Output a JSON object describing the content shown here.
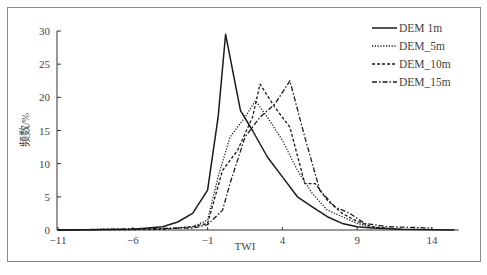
{
  "chart_data": {
    "type": "line",
    "title": "",
    "xlabel": "TWI",
    "ylabel": "频数/%",
    "xlim": [
      -11,
      16
    ],
    "ylim": [
      0,
      30
    ],
    "x_ticks": [
      -11,
      -6,
      -1,
      4,
      9,
      14
    ],
    "y_ticks": [
      0,
      5,
      10,
      15,
      20,
      25,
      30
    ],
    "grid": false,
    "legend_position": "upper right",
    "series": [
      {
        "name": "DEM  1m",
        "style": "solid",
        "points": [
          [
            -11,
            0
          ],
          [
            -6,
            0.1
          ],
          [
            -4,
            0.5
          ],
          [
            -3,
            1.2
          ],
          [
            -2,
            2.5
          ],
          [
            -1,
            6
          ],
          [
            -0.3,
            17
          ],
          [
            0.2,
            29.5
          ],
          [
            1.2,
            18
          ],
          [
            2,
            15
          ],
          [
            3,
            11
          ],
          [
            4,
            8
          ],
          [
            5,
            5
          ],
          [
            6,
            3.5
          ],
          [
            7,
            2
          ],
          [
            8,
            1
          ],
          [
            9,
            0.5
          ],
          [
            10,
            0.3
          ],
          [
            12,
            0.1
          ],
          [
            15.5,
            0
          ]
        ]
      },
      {
        "name": "DEM_5m",
        "style": "dotted",
        "points": [
          [
            -11,
            0
          ],
          [
            -4,
            0.2
          ],
          [
            -2,
            0.5
          ],
          [
            -1,
            1.5
          ],
          [
            -0.3,
            8
          ],
          [
            0.5,
            14
          ],
          [
            1.5,
            17
          ],
          [
            2.2,
            19.5
          ],
          [
            3,
            17
          ],
          [
            4,
            13.5
          ],
          [
            5,
            9
          ],
          [
            6,
            5.5
          ],
          [
            7,
            3
          ],
          [
            8,
            2
          ],
          [
            9,
            1
          ],
          [
            10,
            0.4
          ],
          [
            12,
            0.1
          ]
        ]
      },
      {
        "name": "DEM_10m",
        "style": "dashed",
        "points": [
          [
            -11,
            0
          ],
          [
            -4,
            0.1
          ],
          [
            -2,
            0.5
          ],
          [
            -1,
            1
          ],
          [
            -0.5,
            5
          ],
          [
            0,
            9
          ],
          [
            1,
            12
          ],
          [
            2,
            17
          ],
          [
            2.5,
            22
          ],
          [
            3.5,
            18.5
          ],
          [
            4.5,
            15.5
          ],
          [
            5.5,
            7
          ],
          [
            6.2,
            7
          ],
          [
            7,
            4.5
          ],
          [
            8,
            2.5
          ],
          [
            9,
            1.3
          ],
          [
            10,
            0.5
          ],
          [
            11,
            0.3
          ]
        ]
      },
      {
        "name": "DEM_15m",
        "style": "dash-dot",
        "points": [
          [
            -11,
            0
          ],
          [
            -2,
            0.3
          ],
          [
            -1,
            0.8
          ],
          [
            0,
            3
          ],
          [
            0.5,
            7
          ],
          [
            1.5,
            14
          ],
          [
            2.5,
            17
          ],
          [
            3.5,
            19
          ],
          [
            4.5,
            22.5
          ],
          [
            5.5,
            14
          ],
          [
            6.5,
            6
          ],
          [
            7.5,
            3.5
          ],
          [
            8.5,
            2.5
          ],
          [
            9.5,
            1
          ],
          [
            11,
            0.5
          ],
          [
            14,
            0.3
          ]
        ]
      }
    ]
  },
  "axes": {
    "x_title": "TWI",
    "y_title": "频数/%",
    "x_tick_labels": [
      "−11",
      "−6",
      "−1",
      "4",
      "9",
      "14"
    ],
    "y_tick_labels": [
      "0",
      "5",
      "10",
      "15",
      "20",
      "25",
      "30"
    ]
  },
  "legend": {
    "items": [
      {
        "label": "DEM  1m",
        "dash": ""
      },
      {
        "label": "DEM_5m",
        "dash": "1.2,1.6"
      },
      {
        "label": "DEM_10m",
        "dash": "3,2"
      },
      {
        "label": "DEM_15m",
        "dash": "5,2,1.5,2"
      }
    ]
  },
  "colors": {
    "line": "#1a1a1a",
    "axis": "#333333",
    "frame": "#8a8a8a"
  }
}
